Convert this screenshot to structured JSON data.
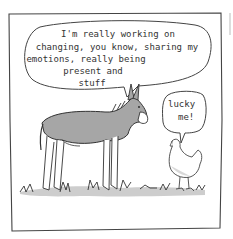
{
  "comic": {
    "speech_donkey": {
      "lines": [
        "I'm  really working on",
        "changing, you know, sharing my",
        "emotions, really being",
        "present and",
        "stuff"
      ]
    },
    "speech_chicken": {
      "lines": [
        "lucky",
        "me!"
      ]
    }
  },
  "colors": {
    "ink": "#333333",
    "donkey_fill": "#a6a6a6",
    "grass_shadow": "#bdbdbd",
    "paper": "#ffffff"
  }
}
